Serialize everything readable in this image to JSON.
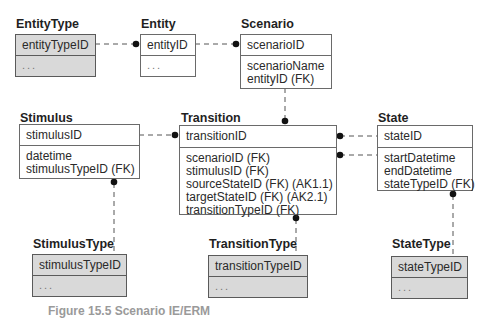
{
  "diagram": {
    "type": "IE entity-relationship model",
    "entities": {
      "entityType": {
        "name": "EntityType",
        "pk": "entityTypeID",
        "attributes": [
          "..."
        ],
        "shaded": true
      },
      "entity": {
        "name": "Entity",
        "pk": "entityID",
        "attributes": [
          "..."
        ],
        "shaded": false
      },
      "scenario": {
        "name": "Scenario",
        "pk": "scenarioID",
        "attributes": [
          "scenarioName",
          "entityID (FK)"
        ],
        "shaded": false
      },
      "stimulus": {
        "name": "Stimulus",
        "pk": "stimulusID",
        "attributes": [
          "datetime",
          "stimulusTypeID (FK)"
        ],
        "shaded": false
      },
      "transition": {
        "name": "Transition",
        "pk": "transitionID",
        "attributes": [
          "scenarioID (FK)",
          "stimulusID (FK)",
          "sourceStateID (FK) (AK1.1)",
          "targetStateID (FK) (AK2.1)",
          "transitionTypeID (FK)"
        ],
        "shaded": false
      },
      "state": {
        "name": "State",
        "pk": "stateID",
        "attributes": [
          "startDatetime",
          "endDatetime",
          "stateTypeID (FK)"
        ],
        "shaded": false
      },
      "stimulusType": {
        "name": "StimulusType",
        "pk": "stimulusTypeID",
        "attributes": [
          "..."
        ],
        "shaded": true
      },
      "transitionType": {
        "name": "TransitionType",
        "pk": "transitionTypeID",
        "attributes": [
          "..."
        ],
        "shaded": true
      },
      "stateType": {
        "name": "StateType",
        "pk": "stateTypeID",
        "attributes": [
          "..."
        ],
        "shaded": true
      }
    },
    "relationships": [
      {
        "from": "EntityType",
        "to": "Entity",
        "style": "dashed",
        "end": "filled-dot"
      },
      {
        "from": "Entity",
        "to": "Scenario",
        "style": "dashed",
        "end": "filled-dot"
      },
      {
        "from": "Scenario",
        "to": "Transition",
        "style": "dashed",
        "end": "filled-dot"
      },
      {
        "from": "Stimulus",
        "to": "Transition",
        "style": "dashed",
        "end": "filled-dot"
      },
      {
        "from": "State",
        "to": "Transition",
        "label": "source",
        "style": "dashed",
        "end": "filled-dot"
      },
      {
        "from": "State",
        "to": "Transition",
        "label": "target",
        "style": "dashed",
        "end": "filled-dot"
      },
      {
        "from": "StimulusType",
        "to": "Stimulus",
        "style": "dashed",
        "end": "filled-dot"
      },
      {
        "from": "TransitionType",
        "to": "Transition",
        "style": "dashed",
        "end": "filled-dot"
      },
      {
        "from": "StateType",
        "to": "State",
        "style": "dashed",
        "end": "filled-dot"
      }
    ],
    "caption": "Figure 15.5 Scenario IE/ERM"
  },
  "colors": {
    "shaded_fill": "#d9d9d9",
    "border": "#6a6a6a",
    "line": "#555555",
    "text": "#2a2a2a"
  }
}
